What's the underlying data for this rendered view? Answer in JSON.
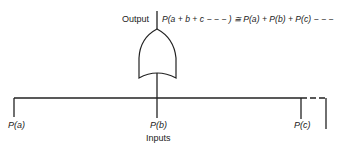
{
  "diagram": {
    "type": "or-gate-probability",
    "output_label": "Output",
    "equation": "P(a + b + c − − − ) ≅ P(a) + P(b) + P(c) − − −",
    "inputs_label": "Inputs",
    "inputs": [
      {
        "label": "P(a)"
      },
      {
        "label": "P(b)"
      },
      {
        "label": "P(c)"
      }
    ],
    "continuation": "dashed",
    "colors": {
      "line": "#222222",
      "background": "#ffffff"
    }
  }
}
